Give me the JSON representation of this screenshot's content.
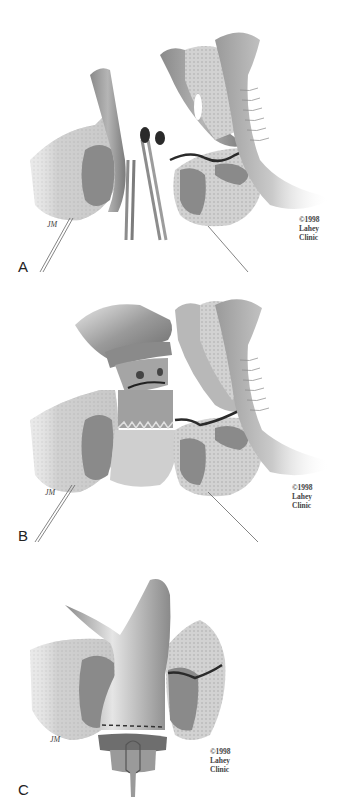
{
  "figure": {
    "style": "grayscale surgical illustration",
    "colors": {
      "background": "#ffffff",
      "tissue_light": "#d8d8d8",
      "tissue_mid": "#a8a8a8",
      "tissue_dark": "#6e6e6e",
      "lumen_dark": "#2a2a2a",
      "instrument": "#9a9a9a"
    },
    "panels": [
      {
        "letter": "A",
        "artist_signature": "JM",
        "copyright_lines": [
          "©1998",
          "Lahey",
          "Clinic"
        ]
      },
      {
        "letter": "B",
        "artist_signature": "JM",
        "copyright_lines": [
          "©1998",
          "Lahey",
          "Clinic"
        ]
      },
      {
        "letter": "C",
        "artist_signature": "JM",
        "copyright_lines": [
          "©1998",
          "Lahey",
          "Clinic"
        ]
      }
    ]
  }
}
